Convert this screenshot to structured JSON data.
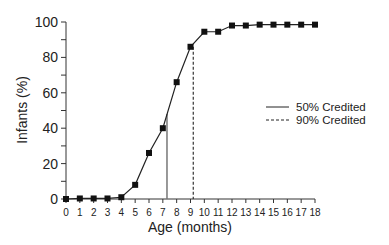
{
  "chart_data": {
    "type": "line",
    "title": "",
    "xlabel": "Age (months)",
    "ylabel": "Infants (%)",
    "xlim": [
      0,
      18
    ],
    "ylim": [
      0,
      100
    ],
    "x_ticks": [
      0,
      1,
      2,
      3,
      4,
      5,
      6,
      7,
      8,
      9,
      10,
      11,
      12,
      13,
      14,
      15,
      16,
      17,
      18
    ],
    "y_ticks": [
      0,
      20,
      40,
      60,
      80,
      100
    ],
    "grid": false,
    "x": [
      0,
      1,
      2,
      3,
      4,
      5,
      6,
      7,
      8,
      9,
      10,
      11,
      12,
      13,
      14,
      15,
      16,
      17,
      18
    ],
    "series": [
      {
        "name": "Infants credited (%)",
        "marker": "square",
        "values": [
          0,
          0.3,
          0.3,
          0.3,
          1,
          8,
          26,
          40,
          66,
          86,
          94.5,
          94.5,
          98,
          98,
          98.5,
          98.5,
          98.5,
          98.5,
          98.5
        ]
      }
    ],
    "reference_lines": [
      {
        "name": "50% Credited",
        "style": "solid",
        "x": 7.3,
        "y_top": 48
      },
      {
        "name": "90% Credited",
        "style": "dashed",
        "x": 9.2,
        "y_top": 86
      }
    ],
    "legend": {
      "position": "right",
      "entries": [
        {
          "label": "50% Credited",
          "style": "solid"
        },
        {
          "label": "90% Credited",
          "style": "dashed"
        }
      ]
    }
  }
}
